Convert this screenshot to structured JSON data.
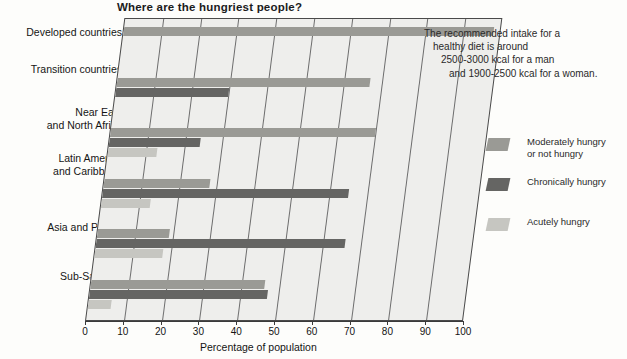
{
  "chart": {
    "title": "Where are the hungriest people?",
    "xaxis_title": "Percentage of population",
    "annotation": {
      "line1": "The recommended intake for a",
      "line2": "healthy diet is around",
      "line3": "2500-3000 kcal for a man",
      "line4": "and 1900-2500 kcal for a woman."
    },
    "legend": [
      {
        "label_line1": "Moderately hungry",
        "label_line2": "or not hungry",
        "color": "#9a9a95",
        "key": "moderate"
      },
      {
        "label_line1": "Chronically hungry",
        "label_line2": "",
        "color": "#656563",
        "key": "chronic"
      },
      {
        "label_line1": "Acutely hungry",
        "label_line2": "",
        "color": "#c6c6c1",
        "key": "acute"
      }
    ],
    "ticks": [
      "0",
      "10",
      "20",
      "30",
      "40",
      "50",
      "60",
      "70",
      "80",
      "90",
      "100"
    ],
    "categories": [
      {
        "line1": "Developed countries",
        "line2": ""
      },
      {
        "line1": "Transition countries",
        "line2": ""
      },
      {
        "line1": "Near East",
        "line2": "and North Africa"
      },
      {
        "line1": "Latin America",
        "line2": "and Caribbean"
      },
      {
        "line1": "Asia and Pacific",
        "line2": ""
      },
      {
        "line1": "Sub-Saharan",
        "line2": "Africa"
      }
    ]
  },
  "chart_data": {
    "type": "bar",
    "orientation": "horizontal",
    "title": "Where are the hungriest people?",
    "xlabel": "Percentage of population",
    "ylabel": "",
    "xlim": [
      0,
      100
    ],
    "xticks": [
      0,
      10,
      20,
      30,
      40,
      50,
      60,
      70,
      80,
      90,
      100
    ],
    "grid": true,
    "legend_position": "right",
    "categories": [
      "Developed countries",
      "Transition countries",
      "Near East and North Africa",
      "Latin America and Caribbean",
      "Asia and Pacific",
      "Sub-Saharan Africa"
    ],
    "series": [
      {
        "name": "Moderately hungry or not hungry",
        "color": "#9a9a95",
        "values": [
          98,
          67,
          70,
          28,
          19,
          46
        ]
      },
      {
        "name": "Chronically hungry",
        "color": "#656563",
        "values": [
          0,
          30,
          24,
          65,
          66,
          47
        ]
      },
      {
        "name": "Acutely hungry",
        "color": "#c6c6c1",
        "values": [
          0,
          0,
          13,
          13,
          18,
          6
        ]
      }
    ],
    "annotations": [
      "The recommended intake for a healthy diet is around 2500-3000 kcal for a man and 1900-2500 kcal for a woman."
    ]
  }
}
